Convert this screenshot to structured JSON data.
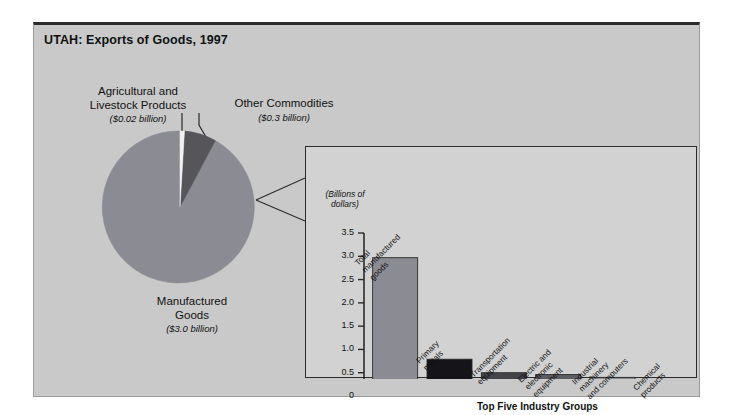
{
  "figure": {
    "title": "UTAH: Exports of Goods, 1997"
  },
  "pie_panel": {
    "labels": {
      "agricultural": {
        "name": "Agricultural and\nLivestock Products",
        "value": "($0.02 billion)"
      },
      "other": {
        "name": "Other Commodities",
        "value": "($0.3 billion)"
      },
      "manufactured": {
        "name": "Manufactured\nGoods",
        "value": "($3.0 billion)"
      }
    }
  },
  "bar_panel": {
    "title": "Exports of Manufactured Goods",
    "axis_unit": "(Billions of\ndollars)",
    "bracket_label": "Top Five Industry Groups"
  },
  "colors": {
    "page_background": "#ffffff",
    "figure_background": "#c9c9c9",
    "panel_background": "#d2d2d2",
    "frame_border": "#2b2b2b",
    "text": "#111111",
    "pie_manufactured": "#8b8b93",
    "pie_other": "#55555a",
    "pie_agricultural": "#f2f2f2",
    "bar_total": "#8b8b93",
    "bar_primary_metals": "#151519",
    "bar_transportation": "#43434a",
    "bar_electric": "#5c5c63",
    "bar_industrial": "#8b8b93",
    "bar_chemical": "#fbfbfb"
  },
  "chart_data": [
    {
      "type": "pie",
      "title": "UTAH: Exports of Goods, 1997",
      "unit": "billions of dollars",
      "categories": [
        "Manufactured Goods",
        "Other Commodities",
        "Agricultural and Livestock Products"
      ],
      "values": [
        3.0,
        0.3,
        0.02
      ],
      "value_labels": [
        "($3.0 billion)",
        "($0.3 billion)",
        "($0.02 billion)"
      ],
      "colors": [
        "#8b8b93",
        "#55555a",
        "#f2f2f2"
      ],
      "legend": "labels with leader lines",
      "start_angle_deg": -90,
      "direction": "clockwise"
    },
    {
      "type": "bar",
      "title": "Exports of Manufactured Goods",
      "xlabel": "",
      "ylabel": "(Billions of dollars)",
      "ylim": [
        0,
        3.5
      ],
      "yticks": [
        0,
        0.5,
        1.0,
        1.5,
        2.0,
        2.5,
        3.0,
        3.5
      ],
      "ytick_labels": [
        "0",
        "0.5",
        "1.0",
        "1.5",
        "2.0",
        "2.5",
        "3.0",
        "3.5"
      ],
      "grid": false,
      "categories": [
        "Total manufactured goods",
        "Primary metals",
        "Transportation equipment",
        "Electric and electronic equipment",
        "Industrial machinery and computers",
        "Chemical products"
      ],
      "category_label_lines": [
        "Total\nmanufactured\ngoods",
        "Primary\nmetals",
        "Transportation\nequipment",
        "Electric and\nelectronic\nequipment",
        "Industrial\nmachinery\nand computers",
        "Chemical\nproducts"
      ],
      "values": [
        2.97,
        0.79,
        0.5,
        0.46,
        0.4,
        0.21
      ],
      "bar_colors": [
        "#8b8b93",
        "#151519",
        "#43434a",
        "#5c5c63",
        "#8b8b93",
        "#fbfbfb"
      ],
      "annotation": {
        "text": "Top Five Industry Groups",
        "spans_categories": [
          1,
          5
        ]
      }
    }
  ]
}
